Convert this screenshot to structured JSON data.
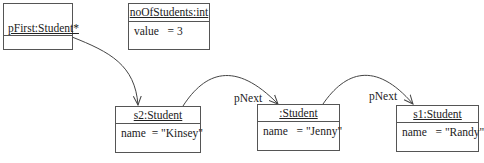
{
  "objects": [
    {
      "id": "pFirst",
      "title": "pFirst:Student*",
      "attributes": []
    },
    {
      "id": "noOfStudents",
      "title": "noOfStudents:int",
      "attributes": [
        "value   = 3"
      ]
    },
    {
      "id": "s2",
      "title": "s2:Student",
      "attributes": [
        "name  = \"Kinsey\""
      ]
    },
    {
      "id": "anon",
      "title": ":Student",
      "attributes": [
        "name   = \"Jenny\""
      ]
    },
    {
      "id": "s1",
      "title": "s1:Student",
      "attributes": [
        "name   = \"Randy\""
      ]
    }
  ],
  "links": [
    {
      "from": "pFirst",
      "to": "s2",
      "label": ""
    },
    {
      "from": "s2",
      "to": "anon",
      "label": "pNext"
    },
    {
      "from": "anon",
      "to": "s1",
      "label": "pNext"
    }
  ]
}
